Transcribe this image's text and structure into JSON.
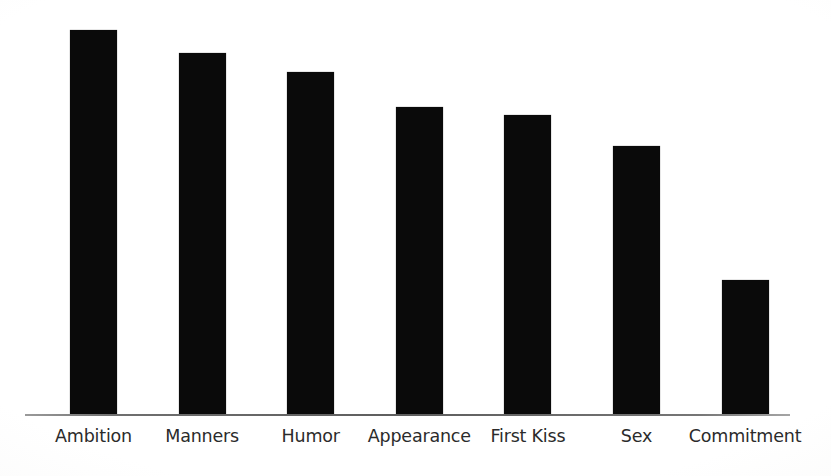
{
  "chart_data": {
    "type": "bar",
    "title": "",
    "subtitle": "",
    "xlabel": "",
    "ylabel": "",
    "categories": [
      "Ambition",
      "Manners",
      "Humor",
      "Appearance",
      "First Kiss",
      "Sex",
      "Commitment"
    ],
    "values": [
      100,
      94,
      89,
      80,
      78,
      70,
      35
    ],
    "series": [
      {
        "name": "",
        "values": [
          100,
          94,
          89,
          80,
          78,
          70,
          35
        ]
      }
    ],
    "ylim": [
      0,
      100
    ],
    "grid": false,
    "legend": false,
    "legend_position": "none",
    "y_axis_visible": false,
    "x_axis_visible": true,
    "data_labels": false,
    "bar_color": "#0a0a0a",
    "axis_color": "#5e5e5e",
    "background_color": "#fefefe",
    "label_color": "#2b2b2b",
    "annotations": []
  },
  "axis": {
    "baseline_label": "x-axis baseline"
  },
  "labels": {
    "items": [
      {
        "text": "Ambition"
      },
      {
        "text": "Manners"
      },
      {
        "text": "Humor"
      },
      {
        "text": "Appearance"
      },
      {
        "text": "First Kiss"
      },
      {
        "text": "Sex"
      },
      {
        "text": "Commitment"
      }
    ]
  }
}
